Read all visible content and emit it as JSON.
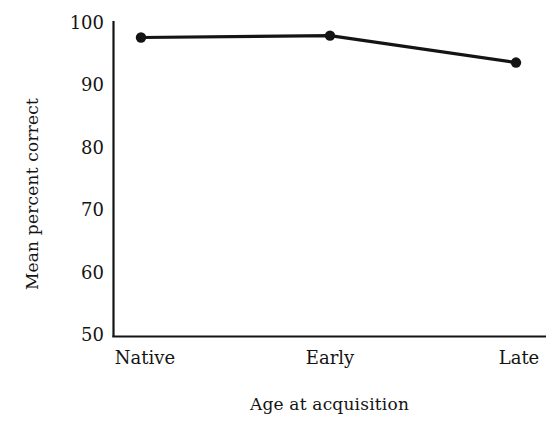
{
  "chart_data": {
    "type": "line",
    "title": "",
    "subtitle": "",
    "xlabel": "Age at acquisition",
    "ylabel": "Mean percent correct",
    "categories": [
      "Native",
      "Early",
      "Late"
    ],
    "values": [
      97.6,
      97.9,
      93.6
    ],
    "series": [
      {
        "name": "Mean percent correct",
        "values": [
          97.6,
          97.9,
          93.6
        ]
      }
    ],
    "ylim": [
      50,
      100
    ],
    "yticks": [
      100,
      90,
      80,
      70,
      60,
      50
    ],
    "ytick_labels": [
      "100",
      "90",
      "80",
      "70",
      "60",
      "50"
    ],
    "xtick_labels": [
      "Native",
      "Early",
      "Late"
    ],
    "grid": false,
    "legend": false,
    "legend_position": "none",
    "line_color": "#141414",
    "marker_color": "#141414",
    "axis_color": "#141414",
    "background_color": "#ffffff"
  },
  "axes": {
    "y_title": "Mean percent correct",
    "x_title": "Age at acquisition"
  }
}
